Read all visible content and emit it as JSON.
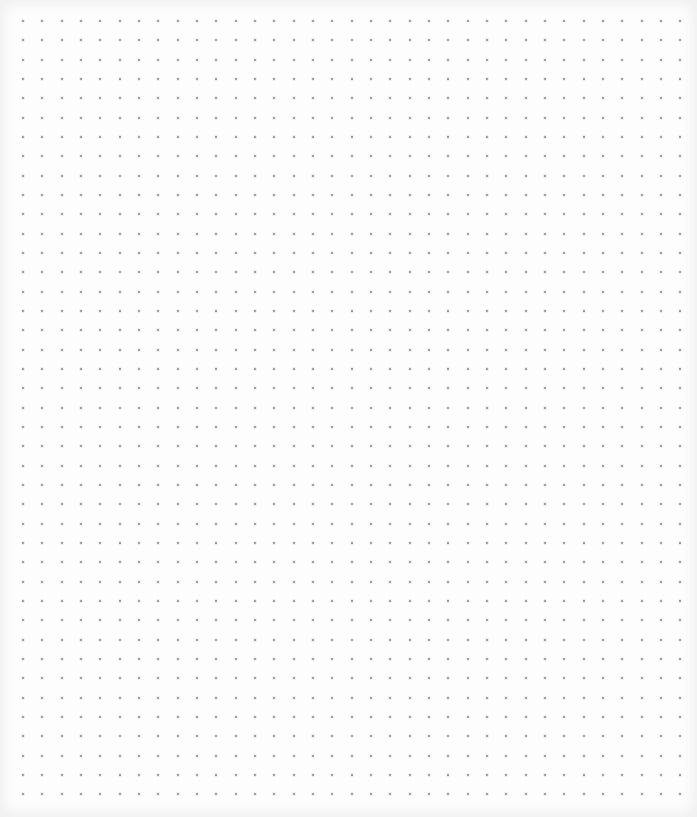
{
  "page": {
    "type": "dot-grid-paper",
    "background_color": "#fdfdfd",
    "dot_color": "#8a8a8a"
  },
  "grid": {
    "columns": 35,
    "rows": 41,
    "origin_x": 23,
    "origin_y": 21,
    "spacing_x": 19.33,
    "spacing_y": 19.33,
    "dot_size": 2
  }
}
